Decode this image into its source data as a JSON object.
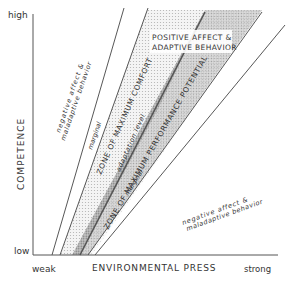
{
  "axes": {
    "y_label": "COMPETENCE",
    "y_high": "high",
    "y_low": "low",
    "x_label": "ENVIRONMENTAL PRESS",
    "x_weak": "weak",
    "x_strong": "strong"
  },
  "regions": {
    "upper_negative_line1": "negative affect &",
    "upper_negative_line2": "maladaptive behavior",
    "upper_marginal": "marginal",
    "max_comfort": "ZONE OF MAXIMUM COMFORT",
    "adaptation_level": "adaptation level",
    "max_performance": "ZONE OF MAXIMUM PERFORMANCE POTENTIAL",
    "lower_marginal": "marginal",
    "positive_line1": "POSITIVE AFFECT &",
    "positive_line2": "ADAPTIVE BEHAVIOR",
    "lower_negative_line1": "negative affect &",
    "lower_negative_line2": "maladaptive behavior"
  },
  "colors": {
    "line": "#444444",
    "light_shade": "#e6e6e6",
    "dark_shade": "#a8a8a8"
  }
}
